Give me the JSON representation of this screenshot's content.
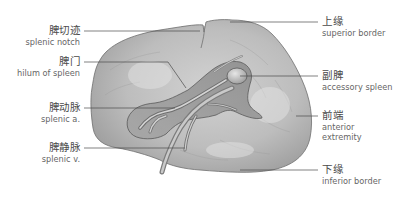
{
  "figure": {
    "colors": {
      "background": "#ffffff",
      "organ_fill": "#b9b9b9",
      "organ_light": "#d6d6d6",
      "organ_dark": "#8a8a8a",
      "outline": "#6a6a6a",
      "leader_line": "#4a4a4a",
      "label_text": "#5a5a5a"
    }
  },
  "labels_left": [
    {
      "zh": "脾切迹",
      "en": "splenic notch"
    },
    {
      "zh": "脾门",
      "en": "hilum of spleen"
    },
    {
      "zh": "脾动脉",
      "en": "splenic a."
    },
    {
      "zh": "脾静脉",
      "en": "splenic v."
    }
  ],
  "labels_right": [
    {
      "zh": "上缘",
      "en": "superior border"
    },
    {
      "zh": "副脾",
      "en": "accessory spleen"
    },
    {
      "zh": "前端",
      "en": "anterior",
      "en2": "extremity"
    },
    {
      "zh": "下缘",
      "en": "inferior border"
    }
  ]
}
